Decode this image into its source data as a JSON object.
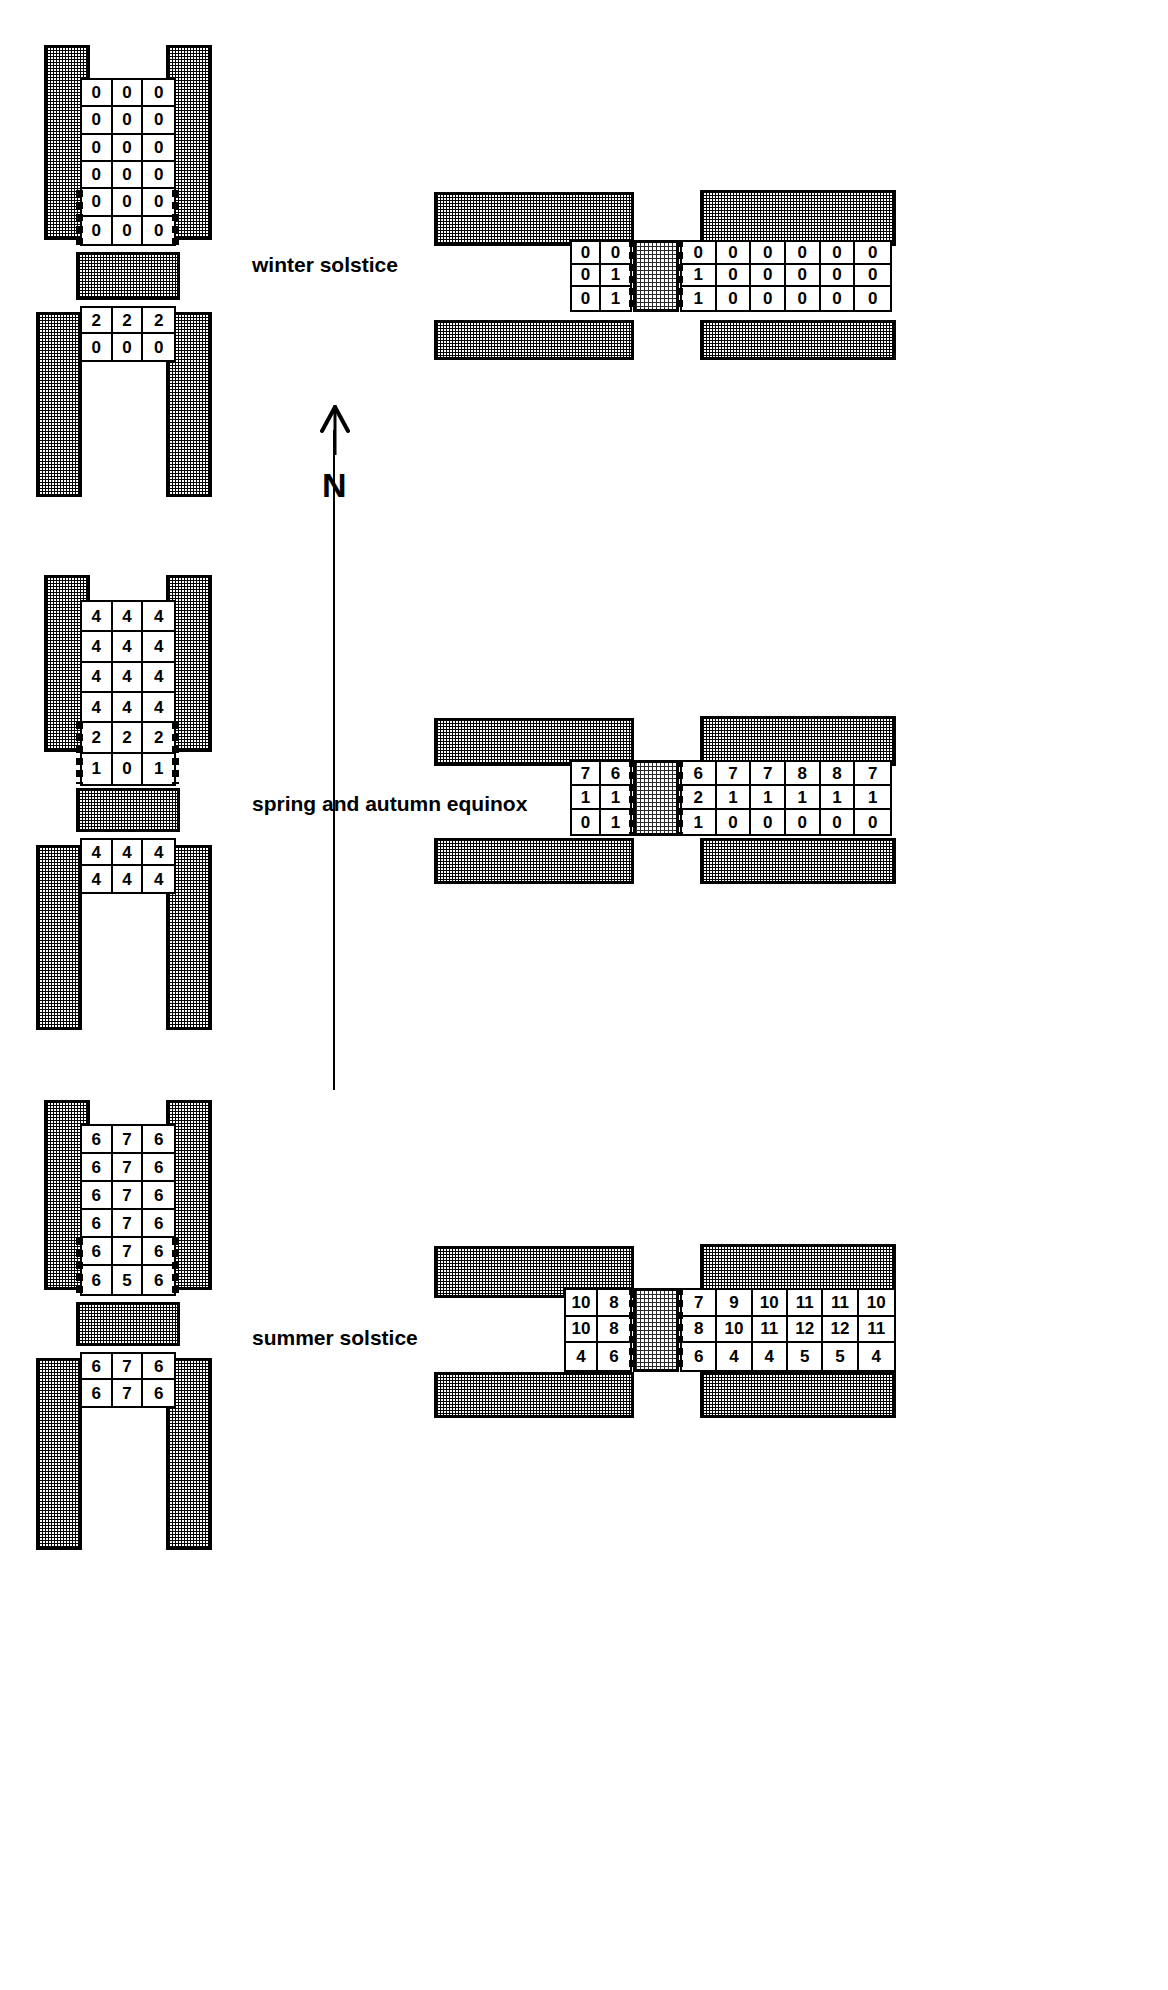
{
  "figure": {
    "type": "architectural-solar-access-diagram",
    "orientation_marker": {
      "letter": "N",
      "meaning": "north-arrow"
    },
    "sections": [
      {
        "id": "winter",
        "label": "winter solstice",
        "left_plan": {
          "upper_grid": {
            "rows": 6,
            "cols": 3,
            "values": [
              [
                0,
                0,
                0
              ],
              [
                0,
                0,
                0
              ],
              [
                0,
                0,
                0
              ],
              [
                0,
                0,
                0
              ],
              [
                0,
                0,
                0
              ],
              [
                0,
                0,
                0
              ]
            ]
          },
          "lower_grid": {
            "rows": 2,
            "cols": 3,
            "values": [
              [
                2,
                2,
                2
              ],
              [
                0,
                0,
                0
              ]
            ]
          }
        },
        "right_plan": {
          "left_grid": {
            "rows": 3,
            "cols": 2,
            "values": [
              [
                0,
                0
              ],
              [
                0,
                1
              ],
              [
                0,
                1
              ]
            ]
          },
          "right_grid": {
            "rows": 3,
            "cols": 6,
            "values": [
              [
                0,
                0,
                0,
                0,
                0,
                0
              ],
              [
                1,
                0,
                0,
                0,
                0,
                0
              ],
              [
                1,
                0,
                0,
                0,
                0,
                0
              ]
            ]
          }
        }
      },
      {
        "id": "equinox",
        "label": "spring and autumn equinox",
        "left_plan": {
          "upper_grid": {
            "rows": 6,
            "cols": 3,
            "values": [
              [
                4,
                4,
                4
              ],
              [
                4,
                4,
                4
              ],
              [
                4,
                4,
                4
              ],
              [
                4,
                4,
                4
              ],
              [
                2,
                2,
                2
              ],
              [
                1,
                0,
                1
              ]
            ]
          },
          "lower_grid": {
            "rows": 2,
            "cols": 3,
            "values": [
              [
                4,
                4,
                4
              ],
              [
                4,
                4,
                4
              ]
            ]
          }
        },
        "right_plan": {
          "left_grid": {
            "rows": 3,
            "cols": 2,
            "values": [
              [
                7,
                6
              ],
              [
                1,
                1
              ],
              [
                0,
                1
              ]
            ]
          },
          "right_grid": {
            "rows": 3,
            "cols": 6,
            "values": [
              [
                6,
                7,
                7,
                8,
                8,
                7
              ],
              [
                2,
                1,
                1,
                1,
                1,
                1
              ],
              [
                1,
                0,
                0,
                0,
                0,
                0
              ]
            ]
          }
        }
      },
      {
        "id": "summer",
        "label": "summer solstice",
        "left_plan": {
          "upper_grid": {
            "rows": 6,
            "cols": 3,
            "values": [
              [
                6,
                7,
                6
              ],
              [
                6,
                7,
                6
              ],
              [
                6,
                7,
                6
              ],
              [
                6,
                7,
                6
              ],
              [
                6,
                7,
                6
              ],
              [
                6,
                5,
                6
              ]
            ]
          },
          "lower_grid": {
            "rows": 2,
            "cols": 3,
            "values": [
              [
                6,
                7,
                6
              ],
              [
                6,
                7,
                6
              ]
            ]
          }
        },
        "right_plan": {
          "left_grid": {
            "rows": 3,
            "cols": 2,
            "values": [
              [
                10,
                8
              ],
              [
                10,
                8
              ],
              [
                4,
                6
              ]
            ]
          },
          "right_grid": {
            "rows": 3,
            "cols": 6,
            "values": [
              [
                7,
                9,
                10,
                11,
                11,
                10
              ],
              [
                8,
                10,
                11,
                12,
                12,
                11
              ],
              [
                6,
                4,
                4,
                5,
                5,
                4
              ]
            ]
          }
        }
      }
    ],
    "colors": {
      "ink": "#000000",
      "paper": "#ffffff",
      "hatch": "#2b2b2b"
    }
  }
}
